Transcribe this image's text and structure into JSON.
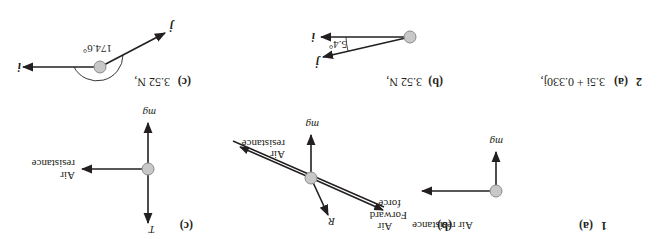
{
  "question1": {
    "number": "1",
    "a": {
      "label": "(a)",
      "forces": {
        "air_resistance": "Air resistance",
        "weight": "mg"
      }
    },
    "b": {
      "label": "(b)",
      "forces": {
        "air_resistance_line1": "Air",
        "air_resistance_line2": "resistance",
        "weight": "mg",
        "reaction": "R",
        "forward_line1": "Forward",
        "forward_line2": "force"
      }
    },
    "c": {
      "label": "(c)",
      "forces": {
        "air_resistance_line1": "Air",
        "air_resistance_line2": "resistance",
        "weight": "mg",
        "tension": "T"
      }
    }
  },
  "question2": {
    "number": "2",
    "a": {
      "label": "(a)",
      "answer": "3.5i + 0.330j,"
    },
    "b": {
      "label": "(b)",
      "answer": "3.52 N,",
      "angle": "5.4°",
      "unit_i": "i",
      "unit_j": "j"
    },
    "c": {
      "label": "(c)",
      "answer": "3.52 N,",
      "angle": "174.6°",
      "unit_i": "i",
      "unit_j": "j"
    }
  },
  "colors": {
    "ink": "#231f20",
    "particle_fill": "#c8c8c8",
    "particle_stroke": "#8a8a8a"
  }
}
